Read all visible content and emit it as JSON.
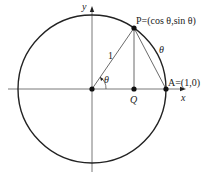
{
  "diagram": {
    "labels": {
      "y_axis": "y",
      "x_axis": "x",
      "point_p": "P=(cos θ,sin θ)",
      "point_a": "A=(1,0)",
      "point_q": "Q",
      "radius": "1",
      "arc_theta": "θ",
      "angle_theta": "θ"
    },
    "colors": {
      "circle": "#222222",
      "axes": "#444444",
      "points": "#111111"
    }
  }
}
